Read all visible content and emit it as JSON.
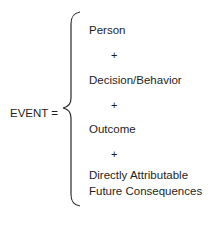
{
  "diagram": {
    "lhs": "EVENT =",
    "components": [
      {
        "label": "Person"
      },
      {
        "label": "Decision/Behavior"
      },
      {
        "label": "Outcome"
      },
      {
        "label": "Directly Attributable",
        "label_line2": "Future Consequences"
      }
    ],
    "operator": "+",
    "operators": [
      "+",
      "+",
      "+"
    ]
  }
}
